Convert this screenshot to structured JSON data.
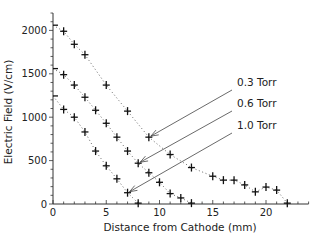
{
  "chart_data": {
    "type": "scatter",
    "title": "",
    "xlabel": "Distance from Cathode (mm)",
    "ylabel": "Electric Field (V/cm)",
    "xlim": [
      0,
      24
    ],
    "ylim": [
      0,
      2200
    ],
    "x_ticks": [
      0,
      5,
      10,
      15,
      20
    ],
    "y_ticks": [
      0,
      500,
      1000,
      1500,
      2000
    ],
    "grid": false,
    "legend": "none (inline annotations with arrows)",
    "series": [
      {
        "name": "0.3 Torr",
        "x": [
          0,
          1,
          2,
          3,
          5,
          7,
          9,
          11,
          13,
          15,
          16,
          17,
          18,
          19,
          20,
          21,
          22
        ],
        "values": [
          2060,
          1990,
          1840,
          1720,
          1370,
          1070,
          770,
          570,
          420,
          320,
          275,
          275,
          220,
          140,
          195,
          160,
          10
        ],
        "marker_at_x0": "tick"
      },
      {
        "name": "0.6 Torr",
        "x": [
          0,
          1,
          2,
          3,
          4,
          5,
          6,
          7,
          8,
          9,
          10,
          11,
          12,
          13
        ],
        "values": [
          1560,
          1490,
          1370,
          1230,
          1080,
          930,
          770,
          610,
          470,
          360,
          250,
          120,
          70,
          10
        ]
      },
      {
        "name": "1.0 Torr",
        "x": [
          0,
          1,
          2,
          3,
          4,
          5,
          6,
          7,
          8
        ],
        "values": [
          1245,
          1090,
          1000,
          830,
          610,
          440,
          290,
          130,
          10
        ]
      }
    ],
    "annotations": [
      {
        "text": "0.3 Torr",
        "arrow_to": [
          9,
          770
        ]
      },
      {
        "text": "0.6 Torr",
        "arrow_to": [
          8,
          470
        ]
      },
      {
        "text": "1.0 Torr",
        "arrow_to": [
          7,
          130
        ]
      }
    ]
  }
}
